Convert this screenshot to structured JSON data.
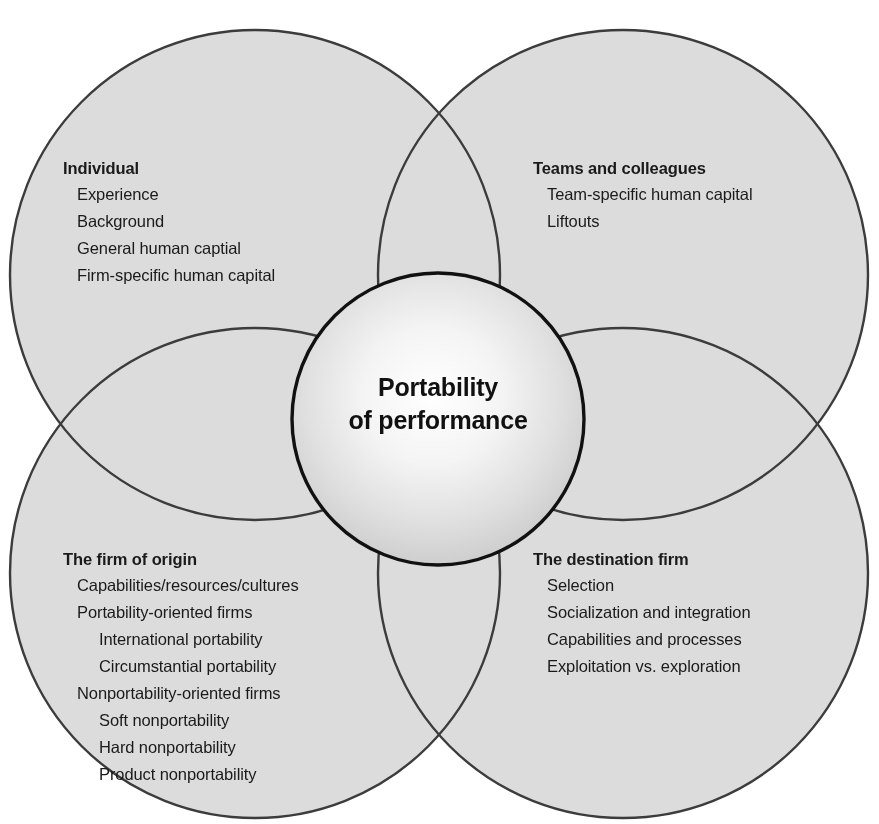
{
  "diagram": {
    "title": "Portability of performance",
    "center": {
      "line1": "Portability",
      "line2": "of performance"
    },
    "colors": {
      "circle_fill": "#dcdcdc",
      "overlap_fill": "#b6b6b6",
      "circle_stroke": "#3c3c3c",
      "center_stroke": "#111111",
      "center_fill_inner": "#fdfdfd",
      "center_fill_outer": "#d2d2d2",
      "background": "#ffffff",
      "text": "#1a1a1a"
    },
    "groups": [
      {
        "id": "individual",
        "heading": "Individual",
        "items": [
          {
            "text": "Experience",
            "level": 1
          },
          {
            "text": "Background",
            "level": 1
          },
          {
            "text": "General human captial",
            "level": 1
          },
          {
            "text": "Firm-specific human capital",
            "level": 1
          }
        ]
      },
      {
        "id": "teams",
        "heading": "Teams and colleagues",
        "items": [
          {
            "text": "Team-specific human capital",
            "level": 1
          },
          {
            "text": "Liftouts",
            "level": 1
          }
        ]
      },
      {
        "id": "origin",
        "heading": "The firm of origin",
        "items": [
          {
            "text": "Capabilities/resources/cultures",
            "level": 1
          },
          {
            "text": "Portability-oriented firms",
            "level": 1
          },
          {
            "text": "International portability",
            "level": 2
          },
          {
            "text": "Circumstantial portability",
            "level": 2
          },
          {
            "text": "Nonportability-oriented firms",
            "level": 1
          },
          {
            "text": "Soft nonportability",
            "level": 2
          },
          {
            "text": "Hard nonportability",
            "level": 2
          },
          {
            "text": "Product nonportability",
            "level": 2
          }
        ]
      },
      {
        "id": "destination",
        "heading": "The destination firm",
        "items": [
          {
            "text": "Selection",
            "level": 1
          },
          {
            "text": "Socialization and integration",
            "level": 1
          },
          {
            "text": "Capabilities and processes",
            "level": 1
          },
          {
            "text": "Exploitation vs. exploration",
            "level": 1
          }
        ]
      }
    ],
    "circles": [
      {
        "id": "top-left",
        "cx": 255,
        "cy": 275,
        "r": 245
      },
      {
        "id": "top-right",
        "cx": 623,
        "cy": 275,
        "r": 245
      },
      {
        "id": "bottom-left",
        "cx": 255,
        "cy": 573,
        "r": 245
      },
      {
        "id": "bottom-right",
        "cx": 623,
        "cy": 573,
        "r": 245
      },
      {
        "id": "center",
        "cx": 438,
        "cy": 419,
        "r": 146
      }
    ]
  }
}
